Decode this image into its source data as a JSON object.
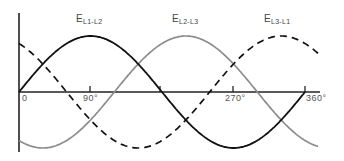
{
  "diagram": {
    "axis": {
      "x_ticks": [
        {
          "label": "0",
          "deg": 0
        },
        {
          "label": "90°",
          "deg": 90
        },
        {
          "label": "180°",
          "deg": 180,
          "hidden_label": true
        },
        {
          "label": "270°",
          "deg": 270
        },
        {
          "label": "360°",
          "deg": 360
        }
      ]
    },
    "series": [
      {
        "name": "E",
        "sub": "L1-L2",
        "phase_deg": 0,
        "style": "solid",
        "color": "#111111"
      },
      {
        "name": "E",
        "sub": "L2-L3",
        "phase_deg": -120,
        "style": "solid",
        "color": "#8c8c8c"
      },
      {
        "name": "E",
        "sub": "L3-L1",
        "phase_deg": 120,
        "style": "dashed",
        "color": "#111111"
      }
    ]
  },
  "labels": {
    "l1": {
      "main": "E",
      "sub": "L1-L2"
    },
    "l2": {
      "main": "E",
      "sub": "L2-L3"
    },
    "l3": {
      "main": "E",
      "sub": "L3-L1"
    },
    "t0": "0",
    "t90": "90°",
    "t270": "270°",
    "t360": "360°"
  }
}
